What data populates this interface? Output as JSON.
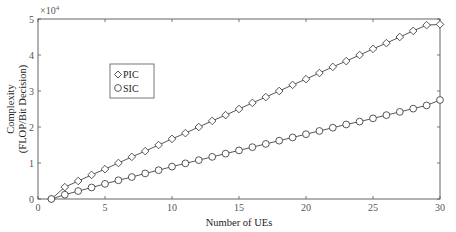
{
  "chart_data": {
    "type": "line",
    "title": "",
    "xlabel": "Number of UEs",
    "ylabel_line1": "Complexity",
    "ylabel_line2": "(FLOP/Bit Decision)",
    "y_multiplier": "×10",
    "y_multiplier_exp": "4",
    "xlim": [
      0,
      30
    ],
    "ylim": [
      0,
      5
    ],
    "x_ticks": [
      0,
      5,
      10,
      15,
      20,
      25,
      30
    ],
    "y_ticks": [
      0,
      1,
      2,
      3,
      4,
      5
    ],
    "grid": false,
    "legend_position": "upper-left-inside",
    "x": [
      1,
      2,
      3,
      4,
      5,
      6,
      7,
      8,
      9,
      10,
      11,
      12,
      13,
      14,
      15,
      16,
      17,
      18,
      19,
      20,
      21,
      22,
      23,
      24,
      25,
      26,
      27,
      28,
      29,
      30
    ],
    "series": [
      {
        "name": "PIC",
        "marker": "diamond",
        "values": [
          0.0,
          0.33,
          0.5,
          0.67,
          0.83,
          1.0,
          1.17,
          1.33,
          1.5,
          1.67,
          1.83,
          2.0,
          2.17,
          2.33,
          2.5,
          2.67,
          2.83,
          3.0,
          3.17,
          3.33,
          3.5,
          3.67,
          3.83,
          4.0,
          4.17,
          4.33,
          4.5,
          4.67,
          4.83,
          4.85
        ]
      },
      {
        "name": "SIC",
        "marker": "circle",
        "values": [
          0.0,
          0.12,
          0.22,
          0.32,
          0.42,
          0.52,
          0.61,
          0.71,
          0.8,
          0.9,
          0.99,
          1.08,
          1.17,
          1.26,
          1.35,
          1.44,
          1.53,
          1.62,
          1.71,
          1.8,
          1.89,
          1.98,
          2.07,
          2.15,
          2.24,
          2.33,
          2.42,
          2.51,
          2.6,
          2.75
        ]
      }
    ]
  },
  "legend": {
    "items": [
      {
        "label": "PIC",
        "symbol": "◇"
      },
      {
        "label": "SIC",
        "symbol": "○"
      }
    ]
  },
  "colors": {
    "axis": "#555555",
    "line": "#444444",
    "marker_fill": "#ffffff"
  }
}
